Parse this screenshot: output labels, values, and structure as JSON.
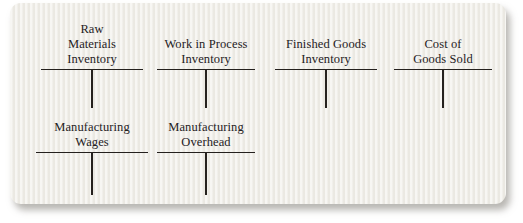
{
  "figure": {
    "type": "t-account-diagram",
    "description": "Six empty T-accounts for manufacturing cost flow"
  },
  "accounts": [
    {
      "name": "Raw Materials Inventory",
      "lines": [
        "Raw",
        "Materials",
        "Inventory"
      ]
    },
    {
      "name": "Work in Process Inventory",
      "lines": [
        "Work in Process",
        "Inventory"
      ]
    },
    {
      "name": "Finished Goods Inventory",
      "lines": [
        "Finished Goods",
        "Inventory"
      ]
    },
    {
      "name": "Cost of Goods Sold",
      "lines": [
        "Cost of",
        "Goods Sold"
      ]
    },
    {
      "name": "Manufacturing Wages",
      "lines": [
        "Manufacturing",
        "Wages"
      ]
    },
    {
      "name": "Manufacturing Overhead",
      "lines": [
        "Manufacturing",
        "Overhead"
      ]
    }
  ],
  "colors": {
    "page_background": "#ffffff",
    "card_background": "#f1efe9",
    "ink": "#25211e",
    "shadow": "#827f72"
  }
}
